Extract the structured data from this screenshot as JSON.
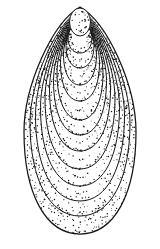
{
  "figure": {
    "type": "scientific-illustration",
    "background_color": "#ffffff",
    "ink_color": "#161616",
    "dot_color": "#141414",
    "width": 160,
    "height": 249
  },
  "shell": {
    "center_x": 80,
    "outline": {
      "top_y": 7,
      "bottom_y": 234,
      "half_width": 56,
      "stroke_width": 1.25
    },
    "growth_lines": {
      "stroke_width": 1.0,
      "top_y": [
        9.5,
        10.4,
        11.3,
        12.2,
        13.1,
        14.0,
        14.9,
        15.8,
        16.7,
        17.6,
        18.5
      ],
      "bottom_y": [
        216,
        201,
        186,
        169,
        151,
        135,
        120,
        101,
        85,
        68,
        53
      ],
      "half_width": [
        50,
        44.5,
        39.5,
        35,
        30.5,
        26.5,
        23,
        19.5,
        16.5,
        14,
        12
      ]
    },
    "umbo": {
      "cx": 80,
      "cy": 22,
      "rx": 10.5,
      "ry": 14,
      "stroke_width": 1.0,
      "dot_count": 28
    },
    "stipple": {
      "seed": 20240917,
      "min_radius": 0.42,
      "max_radius": 0.8,
      "sample_step": 2.4,
      "keep_probability_line": 0.58,
      "keep_probability_band": 0.34,
      "offset_min": 0.8,
      "offset_max": 5.2,
      "outline_band_fractions": [
        0.3,
        0.6,
        0.85
      ],
      "inner_band_fractions": [
        0.5
      ]
    }
  }
}
